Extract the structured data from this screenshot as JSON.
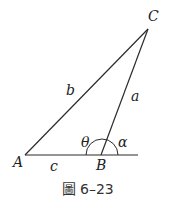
{
  "diagram": {
    "type": "triangle",
    "vertices": {
      "A": {
        "label": "A"
      },
      "B": {
        "label": "B"
      },
      "C": {
        "label": "C"
      }
    },
    "sides": {
      "a": {
        "label": "a"
      },
      "b": {
        "label": "b"
      },
      "c": {
        "label": "c"
      }
    },
    "angles": {
      "theta": {
        "label": "θ"
      },
      "alpha": {
        "label": "α"
      }
    },
    "caption": {
      "icon": "圖",
      "text": "6–23"
    },
    "colors": {
      "line": "#2b2b2b",
      "text": "#222222"
    }
  }
}
